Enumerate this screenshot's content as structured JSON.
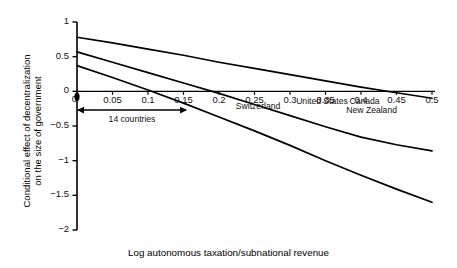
{
  "chart_data": {
    "type": "line",
    "title": "",
    "xlabel": "Log autonomous taxation/subnational revenue",
    "ylabel_line1": "Conditional effect of decentralization",
    "ylabel_line2": "on the size of government",
    "xlim": [
      0,
      0.5
    ],
    "ylim": [
      -2,
      1
    ],
    "grid": false,
    "legend": "none",
    "xticks": [
      0,
      0.05,
      0.1,
      0.15,
      0.2,
      0.25,
      0.3,
      0.35,
      0.4,
      0.45,
      0.5
    ],
    "xtick_labels": [
      "0",
      "0.05",
      "0.1",
      "0.15",
      "0.2",
      "0.25",
      "0.3",
      "0.35",
      "0.4",
      "0.45",
      "0.5"
    ],
    "yticks": [
      1,
      0.5,
      0,
      -0.5,
      -1,
      -1.5,
      -2
    ],
    "ytick_labels": [
      "1",
      "0.5",
      "0",
      "−0.5",
      "−1",
      "−1.5",
      "−2"
    ],
    "series": [
      {
        "name": "upper-confidence-bound",
        "x": [
          0,
          0.05,
          0.1,
          0.15,
          0.2,
          0.25,
          0.3,
          0.35,
          0.4,
          0.45,
          0.5
        ],
        "values": [
          0.78,
          0.7,
          0.61,
          0.52,
          0.42,
          0.33,
          0.24,
          0.15,
          0.06,
          -0.02,
          -0.1
        ]
      },
      {
        "name": "point-estimate",
        "x": [
          0,
          0.05,
          0.1,
          0.15,
          0.2,
          0.25,
          0.3,
          0.35,
          0.4,
          0.45,
          0.5
        ],
        "values": [
          0.57,
          0.42,
          0.27,
          0.12,
          -0.03,
          -0.19,
          -0.35,
          -0.51,
          -0.66,
          -0.77,
          -0.86
        ]
      },
      {
        "name": "lower-confidence-bound",
        "x": [
          0,
          0.05,
          0.1,
          0.15,
          0.2,
          0.25,
          0.3,
          0.35,
          0.4,
          0.45,
          0.5
        ],
        "values": [
          0.37,
          0.2,
          0.02,
          -0.17,
          -0.37,
          -0.57,
          -0.78,
          -1.0,
          -1.21,
          -1.41,
          -1.6
        ]
      }
    ],
    "annotations": [
      {
        "name": "range-arrow",
        "label": "14 countries",
        "x_start": 0,
        "x_end": 0.155,
        "y": -0.27
      },
      {
        "name": "country-switzerland",
        "label": "Switzerland",
        "x": 0.255,
        "y": -0.22
      },
      {
        "name": "country-united-states",
        "label": "United States",
        "x": 0.345,
        "y": -0.155
      },
      {
        "name": "country-canada",
        "label": "Canada",
        "x": 0.405,
        "y": -0.155
      },
      {
        "name": "country-new-zealand",
        "label": "New Zealand",
        "x": 0.415,
        "y": -0.28
      }
    ],
    "origin_label": "0",
    "colors": {
      "line": "#000000",
      "axis": "#000000",
      "text": "#000000",
      "background": "#ffffff"
    }
  }
}
